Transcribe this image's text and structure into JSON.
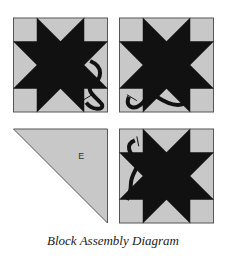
{
  "caption": "Block Assembly Diagram",
  "colors": {
    "background": "#c8c8c8",
    "star": "#111111",
    "border": "#555555"
  },
  "blocks": [
    {
      "id": "top-left",
      "type": "star-block",
      "vine": "bottom-right"
    },
    {
      "id": "top-right",
      "type": "star-block",
      "vine": "bottom-left"
    },
    {
      "id": "bottom-left",
      "type": "triangle",
      "label": "E"
    },
    {
      "id": "bottom-right",
      "type": "star-block",
      "vine": "top-left"
    }
  ]
}
